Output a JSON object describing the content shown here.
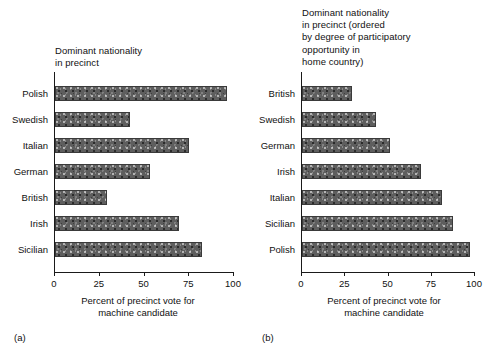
{
  "figure": {
    "panels": [
      {
        "key": "a",
        "caption": "(a)",
        "title": "Dominant nationality\nin precinct",
        "axis_title": "Percent of precinct vote for\nmachine candidate"
      },
      {
        "key": "b",
        "caption": "(b)",
        "title": "Dominant nationality\nin precinct (ordered\nby degree of participatory\nopportunity in\nhome country)",
        "axis_title": "Percent of precinct vote for\nmachine candidate"
      }
    ],
    "bar_color": "#5e5e5e",
    "axis_color": "#1a1a1a"
  },
  "chart_data": [
    {
      "type": "bar",
      "orientation": "horizontal",
      "panel": "(a)",
      "title": "Dominant nationality in precinct",
      "xlabel": "Percent of precinct vote for machine candidate",
      "ylabel": "Dominant nationality in precinct",
      "xlim": [
        0,
        100
      ],
      "xticks": [
        0,
        25,
        50,
        75,
        100
      ],
      "xtick_labels": [
        "0",
        "25",
        "50",
        "75",
        "100"
      ],
      "grid": false,
      "legend": "none",
      "categories": [
        "Polish",
        "Swedish",
        "Italian",
        "German",
        "British",
        "Irish",
        "Sicilian"
      ],
      "values": [
        96,
        42,
        75,
        53,
        29,
        69,
        82
      ]
    },
    {
      "type": "bar",
      "orientation": "horizontal",
      "panel": "(b)",
      "title": "Dominant nationality in precinct (ordered by degree of participatory opportunity in home country)",
      "xlabel": "Percent of precinct vote for machine candidate",
      "ylabel": "Dominant nationality in precinct",
      "xlim": [
        0,
        100
      ],
      "xticks": [
        0,
        25,
        50,
        75,
        100
      ],
      "xtick_labels": [
        "0",
        "25",
        "50",
        "75",
        "100"
      ],
      "grid": false,
      "legend": "none",
      "categories": [
        "British",
        "Swedish",
        "German",
        "Irish",
        "Italian",
        "Sicilian",
        "Polish"
      ],
      "values": [
        29,
        43,
        51,
        69,
        81,
        87,
        97
      ]
    }
  ]
}
